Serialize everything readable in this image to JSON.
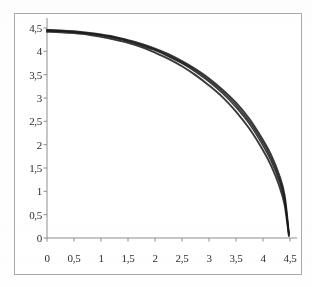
{
  "chart_data": {
    "type": "line",
    "title": "",
    "subtitle": "",
    "xlabel": "",
    "ylabel": "",
    "xlim": [
      0,
      4.5
    ],
    "ylim": [
      0,
      4.5
    ],
    "grid": false,
    "legend": null,
    "legend_position": "none",
    "background_color": "#ffffff",
    "frame_color": "#a8a8a8",
    "line_color": "#1a1a1a",
    "x_ticks": [
      0,
      0.5,
      1,
      1.5,
      2,
      2.5,
      3,
      3.5,
      4,
      4.5
    ],
    "y_ticks": [
      0,
      0.5,
      1,
      1.5,
      2,
      2.5,
      3,
      3.5,
      4,
      4.5
    ],
    "x_tick_labels": [
      "0",
      "0,5",
      "1",
      "1,5",
      "2",
      "2,5",
      "3",
      "3,5",
      "4",
      "4,5"
    ],
    "y_tick_labels": [
      "0",
      "0,5",
      "1",
      "1,5",
      "2",
      "2,5",
      "3",
      "3,5",
      "4",
      "4,5"
    ],
    "decimal_separator": ",",
    "annotations": [],
    "series": [
      {
        "name": "curve-1",
        "x": [
          0,
          0.25,
          0.5,
          0.75,
          1,
          1.25,
          1.5,
          1.75,
          2,
          2.25,
          2.5,
          2.75,
          3,
          3.25,
          3.5,
          3.75,
          4,
          4.15,
          4.3,
          4.4,
          4.48
        ],
        "values": [
          4.46,
          4.45,
          4.43,
          4.4,
          4.36,
          4.31,
          4.24,
          4.16,
          4.06,
          3.94,
          3.79,
          3.62,
          3.42,
          3.18,
          2.9,
          2.55,
          2.1,
          1.78,
          1.35,
          0.92,
          0.1
        ]
      },
      {
        "name": "curve-2",
        "x": [
          0,
          0.25,
          0.5,
          0.75,
          1,
          1.25,
          1.5,
          1.75,
          2,
          2.25,
          2.5,
          2.75,
          3,
          3.25,
          3.5,
          3.75,
          4,
          4.15,
          4.3,
          4.4,
          4.48
        ],
        "values": [
          4.44,
          4.43,
          4.41,
          4.38,
          4.34,
          4.28,
          4.21,
          4.12,
          4.02,
          3.89,
          3.74,
          3.56,
          3.35,
          3.1,
          2.8,
          2.44,
          1.98,
          1.65,
          1.22,
          0.8,
          0.06
        ]
      },
      {
        "name": "curve-3",
        "x": [
          0,
          0.25,
          0.5,
          0.75,
          1,
          1.25,
          1.5,
          1.75,
          2,
          2.25,
          2.5,
          2.75,
          3,
          3.25,
          3.5,
          3.75,
          4,
          4.15,
          4.3,
          4.4,
          4.48
        ],
        "values": [
          4.42,
          4.41,
          4.39,
          4.36,
          4.31,
          4.25,
          4.18,
          4.09,
          3.97,
          3.84,
          3.68,
          3.49,
          3.27,
          3.02,
          2.71,
          2.34,
          1.88,
          1.55,
          1.12,
          0.71,
          0.04
        ]
      },
      {
        "name": "curve-4",
        "x": [
          0,
          0.25,
          0.5,
          0.75,
          1,
          1.25,
          1.5,
          1.75,
          2,
          2.25,
          2.5,
          2.75,
          3,
          3.25,
          3.5,
          3.75,
          4,
          4.15,
          4.3,
          4.4,
          4.48
        ],
        "values": [
          4.45,
          4.44,
          4.42,
          4.39,
          4.35,
          4.3,
          4.23,
          4.14,
          4.04,
          3.91,
          3.76,
          3.59,
          3.38,
          3.14,
          2.85,
          2.49,
          2.04,
          1.71,
          1.28,
          0.86,
          0.08
        ]
      }
    ]
  }
}
